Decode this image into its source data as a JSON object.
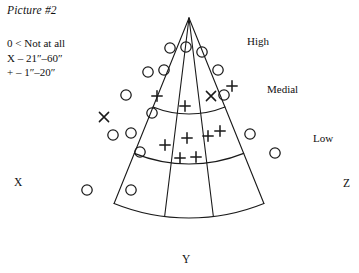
{
  "figure": {
    "title": "Picture #2",
    "legend": [
      "0 < Not at all",
      "X – 21″–60″",
      "+ – 1″–20″"
    ],
    "band_labels": [
      {
        "name": "high",
        "text": "High",
        "x": 247,
        "y": 45
      },
      {
        "name": "medial",
        "text": "Medial",
        "x": 267,
        "y": 93
      },
      {
        "name": "low",
        "text": "Low",
        "x": 313,
        "y": 142
      }
    ],
    "corner_labels": [
      {
        "name": "x",
        "text": "X",
        "x": 14,
        "y": 186
      },
      {
        "name": "y",
        "text": "Y",
        "x": 182,
        "y": 263
      },
      {
        "name": "z",
        "text": "Z",
        "x": 343,
        "y": 187
      }
    ]
  },
  "chart_data": {
    "type": "scatter",
    "title": "Picture #2",
    "xlabel": "",
    "ylabel": "",
    "geometry": {
      "apex": [
        189,
        18
      ],
      "radii": [
        96,
        146,
        200
      ],
      "outer_radius": 200,
      "angle_start_deg": 112,
      "angle_end_deg": 68,
      "radial_divider_angles_deg": [
        112,
        97,
        83,
        68
      ]
    },
    "legend_entries": [
      {
        "symbol": "0",
        "marker": "circle",
        "label": "Not at all"
      },
      {
        "symbol": "X",
        "marker": "x",
        "label": "21″–60″"
      },
      {
        "symbol": "+",
        "marker": "plus",
        "label": "1″–20″"
      }
    ],
    "bands": [
      "High",
      "Medial",
      "Low"
    ],
    "series": [
      {
        "name": "Not at all",
        "marker": "circle",
        "count": 23,
        "points": [
          [
            170,
            48
          ],
          [
            186,
            47
          ],
          [
            202,
            52
          ],
          [
            148,
            72
          ],
          [
            164,
            70
          ],
          [
            218,
            70
          ],
          [
            126,
            95
          ],
          [
            152,
            113
          ],
          [
            224,
            95
          ],
          [
            113,
            135
          ],
          [
            131,
            133
          ],
          [
            140,
            152
          ],
          [
            250,
            134
          ],
          [
            275,
            153
          ],
          [
            87,
            190
          ],
          [
            131,
            190
          ]
        ]
      },
      {
        "name": "21″–60″",
        "marker": "x",
        "count": 2,
        "points": [
          [
            104,
            117
          ],
          [
            211,
            96
          ]
        ]
      },
      {
        "name": "1″–20″",
        "marker": "plus",
        "count": 11,
        "points": [
          [
            157,
            96
          ],
          [
            185,
            106
          ],
          [
            232,
            86
          ],
          [
            165,
            145
          ],
          [
            187,
            138
          ],
          [
            208,
            136
          ],
          [
            220,
            131
          ],
          [
            180,
            158
          ],
          [
            196,
            157
          ]
        ]
      }
    ]
  }
}
